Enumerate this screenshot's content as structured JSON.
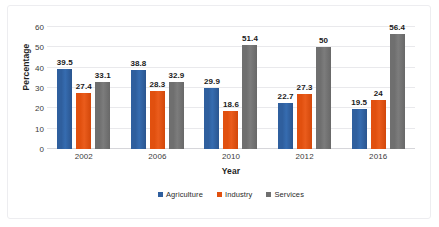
{
  "chart_data": {
    "type": "bar",
    "title": "",
    "xlabel": "Year",
    "ylabel": "Percentage",
    "categories": [
      "2002",
      "2006",
      "2010",
      "2012",
      "2016"
    ],
    "series": [
      {
        "name": "Agriculture",
        "color": "#2f5f9e",
        "values": [
          39.5,
          38.8,
          29.9,
          22.7,
          19.5
        ],
        "labels": [
          "39.5",
          "38.8",
          "29.9",
          "22.7",
          "19.5"
        ]
      },
      {
        "name": "Industry",
        "color": "#e1500f",
        "values": [
          27.4,
          28.3,
          18.6,
          27.3,
          24
        ],
        "labels": [
          "27.4",
          "28.3",
          "18.6",
          "27.3",
          "24"
        ]
      },
      {
        "name": "Services",
        "color": "#6f6f6f",
        "values": [
          33.1,
          32.9,
          51.4,
          50,
          56.4
        ],
        "labels": [
          "33.1",
          "32.9",
          "51.4",
          "50",
          "56.4"
        ]
      }
    ],
    "ylim": [
      0,
      60
    ],
    "yticks": [
      "0",
      "10",
      "20",
      "30",
      "40",
      "50",
      "60"
    ],
    "grid": true,
    "legend_position": "bottom",
    "data_labels": true
  },
  "axes": {
    "y_title": "Percentage",
    "x_title": "Year"
  },
  "legend": {
    "items": [
      {
        "label": "Agriculture"
      },
      {
        "label": "Industry"
      },
      {
        "label": "Services"
      }
    ]
  }
}
